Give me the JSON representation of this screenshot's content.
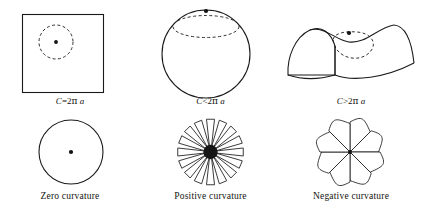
{
  "figure": {
    "background": "#ffffff",
    "ink": "#1a1a1a",
    "columns": [
      {
        "id": "zero",
        "surface_name": "flat-plane-square",
        "formula": {
          "symbol": "C",
          "relation": "=",
          "coefficient": "2",
          "pi": "π",
          "radius": "a",
          "full": "C=2π a"
        },
        "caption": "Zero curvature",
        "flattened_name": "plain-disc"
      },
      {
        "id": "positive",
        "surface_name": "sphere",
        "formula": {
          "symbol": "C",
          "relation": "<",
          "coefficient": "2",
          "pi": "π",
          "radius": "a",
          "full": "C<2π a"
        },
        "caption": "Positive curvature",
        "flattened_name": "gapped-rosette"
      },
      {
        "id": "negative",
        "surface_name": "saddle-surface",
        "formula": {
          "symbol": "C",
          "relation": ">",
          "coefficient": "2",
          "pi": "π",
          "radius": "a",
          "full": "C>2π a"
        },
        "caption": "Negative curvature",
        "flattened_name": "overlapping-pinwheel"
      }
    ],
    "rosette": {
      "petal_count": 16,
      "hub_color": "#151515"
    },
    "pinwheel": {
      "petal_count": 8
    },
    "dashed_circle_label": "geodesic circle of radius a",
    "center_dot_label": "center point"
  }
}
